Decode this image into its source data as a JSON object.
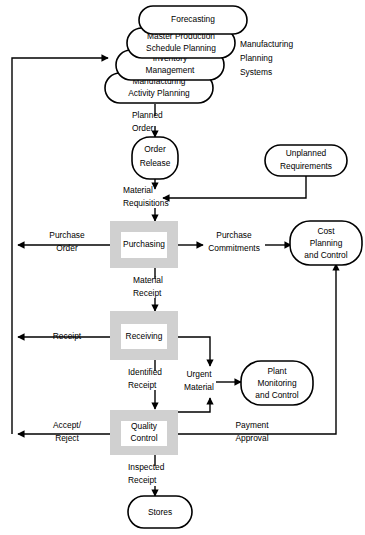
{
  "diagram": {
    "colors": {
      "process_fill": "#d0d0d0",
      "process_inner": "#ffffff",
      "terminal_fill": "#ffffff",
      "line": "#000000"
    },
    "group_label": {
      "line1": "Manufacturing",
      "line2": "Planning",
      "line3": "Systems"
    },
    "nodes": {
      "forecasting": {
        "label": "Forecasting",
        "shape": "rounded"
      },
      "master_production": {
        "line1": "Master Production",
        "line2": "Schedule Planning",
        "shape": "rounded"
      },
      "inventory_management": {
        "line1": "Inventory",
        "line2": "Management",
        "shape": "rounded"
      },
      "manufacturing_activity": {
        "line1": "Manufacturing",
        "line2": "Activity  Planning",
        "shape": "rounded"
      },
      "order_release": {
        "line1": "Order",
        "line2": "Release",
        "shape": "rounded"
      },
      "unplanned_requirements": {
        "line1": "Unplanned",
        "line2": "Requirements",
        "shape": "rounded"
      },
      "purchasing": {
        "label": "Purchasing",
        "shape": "process"
      },
      "receiving": {
        "label": "Receiving",
        "shape": "process"
      },
      "quality_control": {
        "line1": "Quality",
        "line2": "Control",
        "shape": "process"
      },
      "cost_planning": {
        "line1": "Cost",
        "line2": "Planning",
        "line3": "and Control",
        "shape": "rounded"
      },
      "plant_monitoring": {
        "line1": "Plant",
        "line2": "Monitoring",
        "line3": "and Control",
        "shape": "rounded"
      },
      "stores": {
        "label": "Stores",
        "shape": "rounded"
      }
    },
    "flows": {
      "planned_order": {
        "line1": "Planned",
        "line2": "Order"
      },
      "material_requisitions": {
        "line1": "Material",
        "line2": "Requisitions"
      },
      "purchase_order": {
        "line1": "Purchase",
        "line2": "Order"
      },
      "purchase_commitments": {
        "line1": "Purchase",
        "line2": "Commitments"
      },
      "material_receipt": {
        "line1": "Material",
        "line2": "Receipt"
      },
      "receipt": {
        "label": "Receipt"
      },
      "identified_receipt": {
        "line1": "Identified",
        "line2": "Receipt"
      },
      "urgent_material": {
        "line1": "Urgent",
        "line2": "Material"
      },
      "accept_reject": {
        "line1": "Accept/",
        "line2": "Reject"
      },
      "payment_approval": {
        "line1": "Payment",
        "line2": "Approval"
      },
      "inspected_receipt": {
        "line1": "Inspected",
        "line2": "Receipt"
      }
    }
  }
}
